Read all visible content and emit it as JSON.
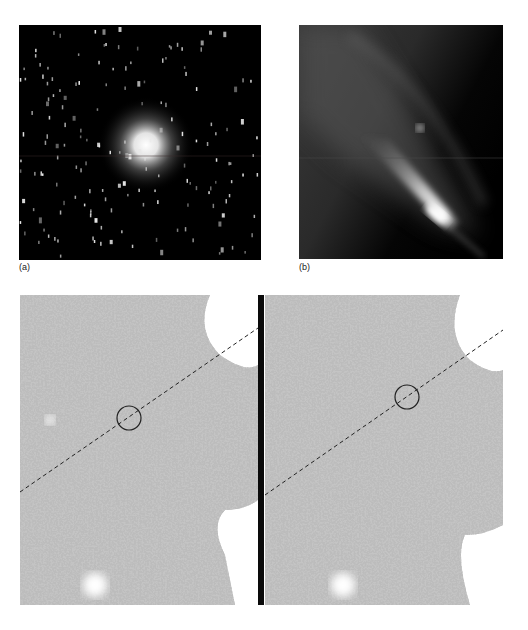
{
  "figure": {
    "panels": [
      {
        "id": "a",
        "label": "(a)",
        "description": "Comet with bright coma against dense star field"
      },
      {
        "id": "b",
        "label": "(b)",
        "description": "Elongated bright diagonal tail / fan structure"
      },
      {
        "id": "c-left",
        "label": "",
        "description": "Noisy grayscale field with dashed line and circled target"
      },
      {
        "id": "c-right",
        "label": "",
        "description": "Noisy grayscale field with dashed line and circled target, shifted"
      }
    ],
    "colors": {
      "background": "#ffffff",
      "sky": "#000000",
      "noise_field": "#b8b8b8",
      "divider": "#0a0a0a",
      "annotation": "#222222"
    }
  }
}
